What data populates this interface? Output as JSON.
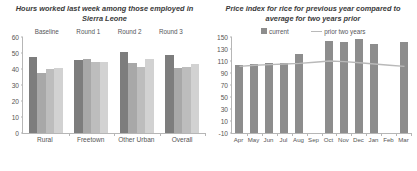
{
  "chart_data": [
    {
      "type": "bar",
      "title": "Hours worked last week among those employed in Sierra Leone",
      "xlabel": "",
      "ylabel": "",
      "ylim": [
        0,
        60
      ],
      "yticks": [
        60,
        50,
        40,
        30,
        20,
        10,
        0
      ],
      "grid": false,
      "legend_position": "top-center",
      "categories": [
        "Rural",
        "Freetown",
        "Other Urban",
        "Overall"
      ],
      "series": [
        {
          "name": "Baseline",
          "color": "#7d7d7d",
          "values": [
            47.5,
            45.5,
            50.5,
            48.5
          ]
        },
        {
          "name": "Round 1",
          "color": "#a8a8a8",
          "values": [
            37.5,
            46.5,
            43.5,
            40.5
          ]
        },
        {
          "name": "Round 2",
          "color": "#bdbdbd",
          "values": [
            40.0,
            44.5,
            41.5,
            41.5
          ]
        },
        {
          "name": "Round 3",
          "color": "#d2d2d2",
          "values": [
            40.5,
            44.5,
            46.5,
            43.0
          ]
        }
      ]
    },
    {
      "type": "bar",
      "title": "Price index for rice for previous year compared to average for two years prior",
      "xlabel": "",
      "ylabel": "",
      "ylim": [
        -10,
        150
      ],
      "yticks": [
        150,
        130,
        110,
        90,
        70,
        50,
        30,
        10,
        -10
      ],
      "grid": false,
      "legend_position": "top-center",
      "categories": [
        "Apr",
        "May",
        "Jun",
        "Jul",
        "Aug",
        "Sep",
        "Oct",
        "Nov",
        "Dec",
        "Jan",
        "Feb",
        "Mar"
      ],
      "series": [
        {
          "name": "current",
          "color": "#8d8d8d",
          "type": "bar",
          "values": [
            104,
            105,
            106,
            107,
            122,
            null,
            143,
            142,
            146,
            139,
            null,
            142
          ]
        },
        {
          "name": "prior two years",
          "color": "#b9b9b9",
          "type": "line",
          "values": [
            101,
            103,
            104,
            105,
            106,
            108,
            110,
            109,
            107,
            105,
            103,
            101
          ]
        }
      ]
    }
  ],
  "left_chart": {
    "title": "Hours worked last week among those employed in Sierra Leone",
    "legend": [
      {
        "label": "Baseline"
      },
      {
        "label": "Round 1"
      },
      {
        "label": "Round 2"
      },
      {
        "label": "Round 3"
      }
    ]
  },
  "right_chart": {
    "title": "Price index for rice for previous year compared to average for two years prior",
    "legend": [
      {
        "label": "current"
      },
      {
        "label": "prior two years"
      }
    ]
  }
}
